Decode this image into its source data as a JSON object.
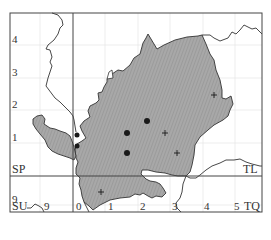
{
  "map": {
    "colors": {
      "fill": "#a8a8a8",
      "hatch": "#8c8c8c",
      "border": "#333333",
      "grid": "#e6e6e6",
      "frame": "#444444",
      "dot": "#1a1a1a"
    },
    "grid_squares": {
      "top_left": "SP",
      "top_right": "TL",
      "bottom_left": "SU",
      "bottom_right": "TQ"
    },
    "y_ticks_upper": [
      "4",
      "3",
      "2",
      "1"
    ],
    "y_ticks_lower": [
      "9"
    ],
    "x_ticks": [
      "9",
      "0",
      "1",
      "2",
      "3",
      "4",
      "5"
    ],
    "markers": {
      "dots": [
        {
          "x": 147,
          "y": 121
        },
        {
          "x": 127,
          "y": 133
        },
        {
          "x": 127,
          "y": 153
        },
        {
          "x": 77,
          "y": 135
        },
        {
          "x": 77,
          "y": 147
        }
      ],
      "crosses": [
        {
          "x": 214,
          "y": 95
        },
        {
          "x": 165,
          "y": 133
        },
        {
          "x": 177,
          "y": 153
        },
        {
          "x": 101,
          "y": 192
        }
      ]
    }
  }
}
